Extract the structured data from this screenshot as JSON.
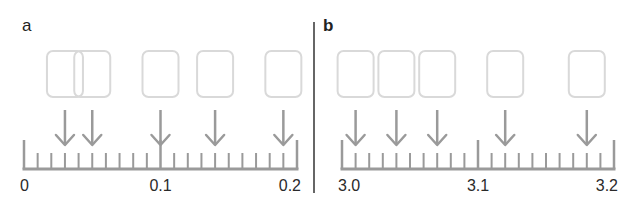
{
  "colors": {
    "axis": "#9a9a9a",
    "arrow": "#9a9a9a",
    "box": "#d9d9d9",
    "divider": "#333333",
    "text": "#2a2a2a"
  },
  "panels": [
    {
      "label": "a",
      "axis": {
        "min": 0,
        "max": 0.2,
        "minor_step": 0.01,
        "major_step": 0.1,
        "tick_labels": [
          "0",
          "0.1",
          "0.2"
        ]
      },
      "markers": [
        0.03,
        0.05,
        0.1,
        0.14,
        0.19
      ]
    },
    {
      "label": "b",
      "axis": {
        "min": 3.0,
        "max": 3.2,
        "minor_step": 0.01,
        "major_step": 0.1,
        "tick_labels": [
          "3.0",
          "3.1",
          "3.2"
        ]
      },
      "markers": [
        3.01,
        3.04,
        3.07,
        3.12,
        3.18
      ]
    }
  ]
}
